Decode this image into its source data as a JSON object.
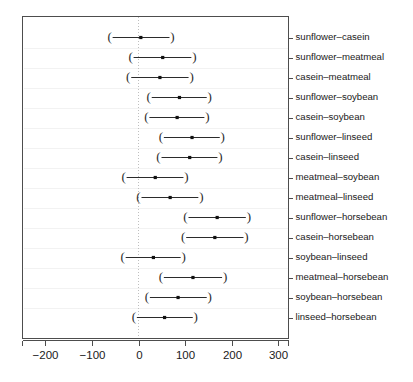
{
  "chart_data": {
    "type": "scatter",
    "subtype": "confidence-interval-dotplot",
    "title": "",
    "subtitle": "",
    "xlabel": "",
    "ylabel": "",
    "xlim": [
      -230,
      320
    ],
    "xticks": [
      -200,
      -100,
      0,
      100,
      200,
      300
    ],
    "xticklabels": [
      "-200",
      "-100",
      "0",
      "100",
      "200",
      "300"
    ],
    "grid": false,
    "legend": null,
    "reference_line": {
      "x": 0,
      "style": "dotted",
      "color": "#bfbfbf"
    },
    "categories": [
      "sunflower–casein",
      "sunflower–meatmeal",
      "casein–meatmeal",
      "sunflower–soybean",
      "casein–soybean",
      "sunflower–linseed",
      "casein–linseed",
      "meatmeal–soybean",
      "meatmeal–linseed",
      "sunflower–horsebean",
      "casein–horsebean",
      "soybean–linseed",
      "meatmeal–horsebean",
      "soybean–horsebean",
      "linseed–horsebean"
    ],
    "series": [
      {
        "name": "difference in mean",
        "estimate": [
          5,
          52,
          46,
          88,
          83,
          115,
          110,
          36,
          68,
          169,
          164,
          32,
          117,
          85,
          56
        ],
        "lower": [
          -62,
          -17,
          -22,
          22,
          17,
          48,
          43,
          -32,
          0,
          101,
          96,
          -34,
          48,
          18,
          -10
        ],
        "upper": [
          73,
          120,
          114,
          153,
          148,
          181,
          176,
          103,
          135,
          237,
          232,
          97,
          186,
          153,
          123
        ]
      }
    ]
  },
  "axis": {
    "tick_labels": [
      "-200",
      "-100",
      "0",
      "100",
      "200",
      "300"
    ]
  },
  "row_labels": [
    "sunflower–casein",
    "sunflower–meatmeal",
    "casein–meatmeal",
    "sunflower–soybean",
    "casein–soybean",
    "sunflower–linseed",
    "casein–linseed",
    "meatmeal–soybean",
    "meatmeal–linseed",
    "sunflower–horsebean",
    "casein–horsebean",
    "soybean–linseed",
    "meatmeal–horsebean",
    "soybean–horsebean",
    "linseed–horsebean"
  ],
  "caps": {
    "left": "(",
    "right": ")"
  },
  "colors": {
    "interval": "#2b2b2b",
    "point": "#111111",
    "zero_line": "#bfbfbf",
    "panel_border": "#4d4d4d",
    "text": "#1a1a1a",
    "background": "#ffffff"
  }
}
